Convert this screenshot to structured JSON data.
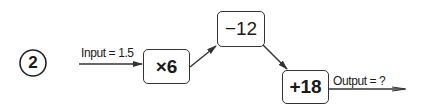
{
  "question_number": "2",
  "input_label": "Input = 1.5",
  "output_label": "Output = ?",
  "steps": [
    {
      "label": "×6"
    },
    {
      "label": "−12"
    },
    {
      "label": "+18"
    }
  ],
  "colors": {
    "stroke": "#333333",
    "text": "#1a1a1a"
  }
}
